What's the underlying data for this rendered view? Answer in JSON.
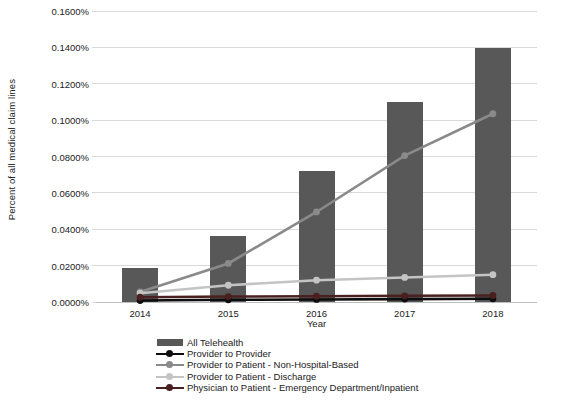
{
  "chart_data": {
    "type": "bar",
    "title": "",
    "xlabel": "Year",
    "ylabel": "Percent of all medical claim lines",
    "categories": [
      "2014",
      "2015",
      "2016",
      "2017",
      "2018"
    ],
    "ylim": [
      0.0,
      0.16
    ],
    "ytick_values": [
      0.0,
      0.02,
      0.04,
      0.06,
      0.08,
      0.1,
      0.12,
      0.14,
      0.16
    ],
    "ytick_labels": [
      "0.0000%",
      "0.0200%",
      "0.0400%",
      "0.0600%",
      "0.0800%",
      "0.1000%",
      "0.1200%",
      "0.1400%",
      "0.1600%"
    ],
    "grid": true,
    "legend_position": "bottom",
    "series": [
      {
        "name": "All Telehealth",
        "kind": "bar",
        "color": "#585858",
        "values": [
          0.0185,
          0.0365,
          0.0723,
          0.11,
          0.1395
        ]
      },
      {
        "name": "Provider to Provider",
        "kind": "line",
        "color": "#0d0d0d",
        "values": [
          0.0008,
          0.0012,
          0.0014,
          0.0016,
          0.0018
        ]
      },
      {
        "name": "Provider to Patient - Non-Hospital-Based",
        "kind": "line",
        "color": "#8a8a8a",
        "values": [
          0.0055,
          0.0212,
          0.0495,
          0.0805,
          0.1035
        ]
      },
      {
        "name": "Provider to Patient - Discharge",
        "kind": "line",
        "color": "#c4c4c4",
        "values": [
          0.0048,
          0.0092,
          0.012,
          0.0135,
          0.015
        ]
      },
      {
        "name": "Physician to Patient - Emergency Department/Inpatient",
        "kind": "line",
        "color": "#4a1f1f",
        "values": [
          0.0026,
          0.003,
          0.0032,
          0.0034,
          0.0036
        ]
      }
    ]
  }
}
